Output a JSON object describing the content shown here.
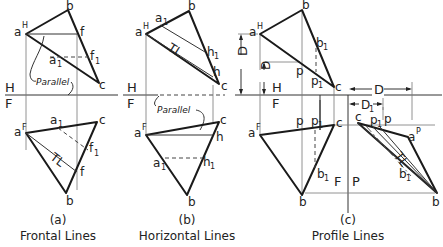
{
  "figure": {
    "panels": [
      {
        "id": "a",
        "caption_letter": "(a)",
        "caption_title": "Frontal Lines",
        "fold_top": "H",
        "fold_bottom": "F",
        "parallel_label": "Parallel",
        "true_length": "TL",
        "top_view_points": [
          "a",
          "H",
          "b",
          "f",
          "a",
          "1",
          "f",
          "1",
          "c"
        ],
        "front_view_points": [
          "a",
          "F",
          "a",
          "1",
          "c",
          "f",
          "1",
          "f",
          "b"
        ]
      },
      {
        "id": "b",
        "caption_letter": "(b)",
        "caption_title": "Horizontal Lines",
        "fold_top": "H",
        "fold_bottom": "F",
        "parallel_label": "Parallel",
        "true_length": "TL"
      },
      {
        "id": "c",
        "caption_letter": "(c)",
        "caption_title": "Profile Lines",
        "fold_top": "H",
        "fold_bottom": "F",
        "fold_side_left": "F",
        "fold_side_right": "P",
        "dim_D": "D",
        "dim_D1": "D",
        "true_length": "TL"
      }
    ]
  },
  "labels": {
    "a": "a",
    "b": "b",
    "c": "c",
    "f": "f",
    "h": "h",
    "p": "p",
    "sub1": "1",
    "supH": "H",
    "supF": "F",
    "supP": "P",
    "H": "H",
    "F": "F",
    "P": "P",
    "D": "D",
    "TL": "TL",
    "parallel": "Parallel"
  }
}
